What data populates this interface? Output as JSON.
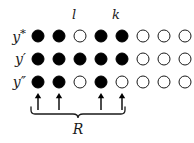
{
  "figure": {
    "title": "",
    "background_color": "#ffffff",
    "ink_color": "#000000",
    "row_labels": [
      {
        "id": "y-star",
        "text": "y*"
      },
      {
        "id": "y-prime",
        "text": "y′"
      },
      {
        "id": "y-double-prime",
        "text": "y″"
      }
    ],
    "column_labels": [
      {
        "id": "l",
        "text": "l",
        "column": 3
      },
      {
        "id": "k",
        "text": "k",
        "column": 5
      }
    ],
    "columns": 8,
    "rows": [
      {
        "label": "y*",
        "nodes": [
          "filled",
          "filled",
          "open",
          "filled",
          "filled",
          "open",
          "open",
          "open"
        ]
      },
      {
        "label": "y′",
        "nodes": [
          "filled",
          "filled",
          "filled",
          "filled",
          "filled",
          "open",
          "open",
          "open"
        ]
      },
      {
        "label": "y″",
        "nodes": [
          "filled",
          "filled",
          "open",
          "filled",
          "open",
          "open",
          "open",
          "open"
        ]
      }
    ],
    "arrows": {
      "direction": "up",
      "columns": [
        1,
        2,
        4,
        5
      ]
    },
    "brace": {
      "label": "R",
      "spans_columns": [
        1,
        5
      ],
      "orientation": "bottom"
    },
    "legend": {
      "filled_meaning": "filled",
      "open_meaning": "open"
    }
  }
}
